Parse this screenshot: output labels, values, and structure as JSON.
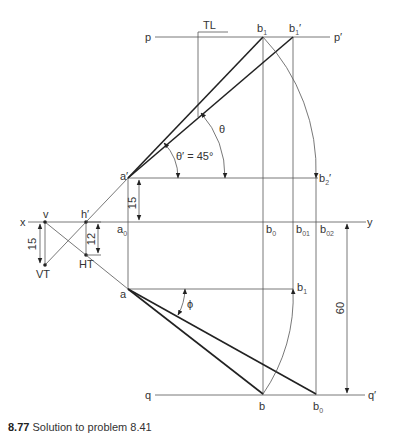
{
  "diagram": {
    "reference_line": {
      "left": "x",
      "right": "y"
    },
    "locus_lines": {
      "top_left": "p",
      "top_right": "p′",
      "bottom_left": "q",
      "bottom_right": "q′"
    },
    "points": {
      "a_prime": "a′",
      "a": "a",
      "a0": "a",
      "a0_sub": "0",
      "b1_top": "b",
      "b1_top_sub": "1",
      "b1_prime": "b",
      "b1_prime_sub": "1",
      "b1_prime_mark": "′",
      "b2_prime": "b",
      "b2_prime_sub": "2",
      "b2_prime_mark": "′",
      "b0": "b",
      "b0_sub": "0",
      "b01": "b",
      "b01_sub": "01",
      "b02": "b",
      "b02_sub": "02",
      "b1_low": "b",
      "b1_low_sub": "1",
      "b": "b",
      "b0_bottom": "b",
      "b0_bottom_sub": "0",
      "v": "v",
      "h_prime": "h′",
      "VT": "VT",
      "HT": "HT"
    },
    "annotations": {
      "true_length": "TL",
      "theta": "θ",
      "theta_prime": "θ′ = 45°",
      "phi": "ϕ"
    },
    "dimensions": {
      "a_prime_above_xy": "15",
      "vt_below_xy": "15",
      "ht_below_xy": "12",
      "b_below_xy": "60"
    }
  },
  "caption": {
    "number": "8.77",
    "text": "Solution to problem 8.41"
  }
}
